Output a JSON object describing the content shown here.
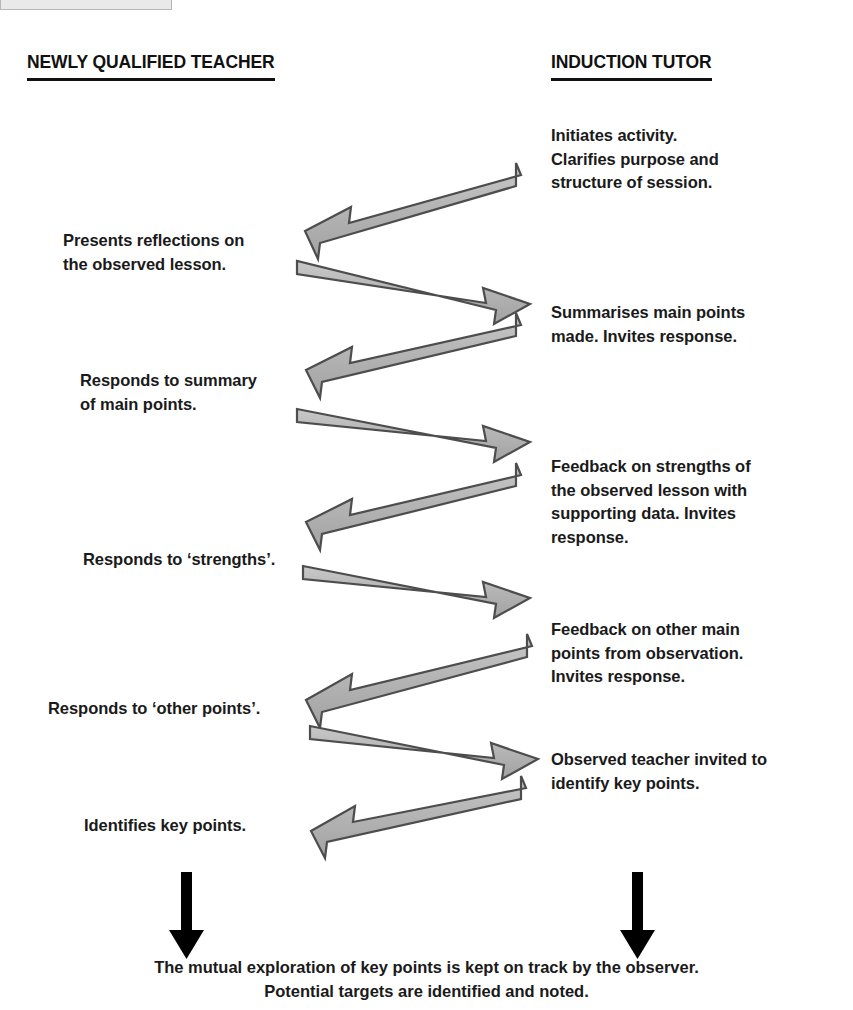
{
  "banner": {
    "text": "IN THE INDUCTION PERIOD"
  },
  "columns": {
    "left_heading": "NEWLY QUALIFIED TEACHER",
    "right_heading": "INDUCTION TUTOR"
  },
  "steps": [
    {
      "id": "initiates-activity",
      "side": "right",
      "text": "Initiates activity.\nClarifies purpose and\nstructure of session."
    },
    {
      "id": "presents-reflections",
      "side": "left",
      "text": "Presents reflections on\nthe observed lesson."
    },
    {
      "id": "summarises-main-points",
      "side": "right",
      "text": "Summarises main points\nmade. Invites response."
    },
    {
      "id": "responds-to-summary",
      "side": "left",
      "text": "Responds to summary\nof main points."
    },
    {
      "id": "feedback-on-strengths",
      "side": "right",
      "text": "Feedback on strengths of\nthe observed lesson with\nsupporting data. Invites\nresponse."
    },
    {
      "id": "responds-to-strengths",
      "side": "left",
      "text": "Responds to ‘strengths’."
    },
    {
      "id": "feedback-on-other-points",
      "side": "right",
      "text": "Feedback on other main\npoints from observation.\nInvites response."
    },
    {
      "id": "responds-to-other-points",
      "side": "left",
      "text": "Responds to ‘other points’."
    },
    {
      "id": "observed-teacher-invited",
      "side": "right",
      "text": "Observed teacher invited to\nidentify key points."
    },
    {
      "id": "identifies-key-points",
      "side": "left",
      "text": "Identifies key points."
    }
  ],
  "summary": {
    "text": "The mutual exploration of key points is kept on track by the observer.\nPotential targets are identified and noted."
  },
  "arrows": {
    "count": 9,
    "down_arrow_count": 2,
    "directions": [
      "right-to-left",
      "left-to-right",
      "right-to-left",
      "left-to-right",
      "right-to-left",
      "left-to-right",
      "right-to-left",
      "left-to-right",
      "right-to-left"
    ]
  },
  "colors": {
    "arrow_fill": "#b3b3b3",
    "arrow_stroke": "#4d4d4d",
    "text": "#1a1a1a",
    "rule": "#111111",
    "down_arrow": "#000000",
    "banner_bg": "#e9e9e9"
  }
}
